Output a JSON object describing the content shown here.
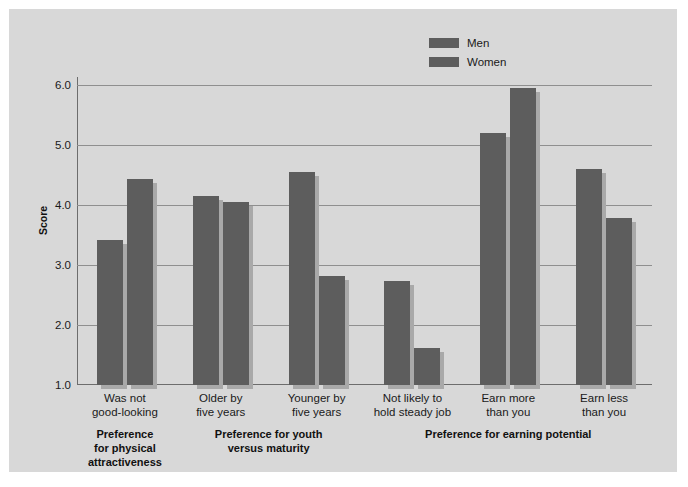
{
  "chart_data": {
    "type": "bar",
    "title": "",
    "subtitle": "",
    "xlabel": "",
    "ylabel": "Score",
    "ylim": [
      1.0,
      6.0
    ],
    "yticks": [
      "1.0",
      "2.0",
      "3.0",
      "4.0",
      "5.0",
      "6.0"
    ],
    "grid": true,
    "legend_position": "top-center-right",
    "categories": [
      "Was not\ngood-looking",
      "Older by\nfive years",
      "Younger by\nfive years",
      "Not likely to\nhold steady job",
      "Earn more\nthan you",
      "Earn less\nthan you"
    ],
    "series": [
      {
        "name": "Men",
        "color": "#5d5d5d",
        "values": [
          3.42,
          4.15,
          4.55,
          2.73,
          5.2,
          4.6
        ]
      },
      {
        "name": "Women",
        "color": "#5d5d5d",
        "values": [
          4.43,
          4.05,
          2.81,
          1.62,
          5.95,
          3.78
        ]
      }
    ],
    "group_bands": [
      {
        "label": "Preference\nfor physical\nattractiveness",
        "categories": [
          0
        ]
      },
      {
        "label": "Preference for youth\nversus maturity",
        "categories": [
          1,
          2
        ]
      },
      {
        "label": "Preference for earning potential",
        "categories": [
          3,
          4,
          5
        ]
      }
    ]
  },
  "axis": {
    "y_label": "Score",
    "y_tick_labels": [
      "6.0",
      "5.0",
      "4.0",
      "3.0",
      "2.0",
      "1.0"
    ],
    "y_tick_values": [
      6.0,
      5.0,
      4.0,
      3.0,
      2.0,
      1.0
    ]
  },
  "legend": {
    "items": [
      {
        "label": "Men",
        "color": "#5d5d5d"
      },
      {
        "label": "Women",
        "color": "#5d5d5d"
      }
    ]
  },
  "categories": [
    {
      "line1": "Was not",
      "line2": "good-looking"
    },
    {
      "line1": "Older by",
      "line2": "five years"
    },
    {
      "line1": "Younger by",
      "line2": "five years"
    },
    {
      "line1": "Not likely to",
      "line2": "hold steady job"
    },
    {
      "line1": "Earn more",
      "line2": "than you"
    },
    {
      "line1": "Earn less",
      "line2": "than you"
    }
  ],
  "group_labels": [
    {
      "line1": "Preference",
      "line2": "for physical",
      "line3": "attractiveness"
    },
    {
      "line1": "Preference for youth",
      "line2": "versus maturity",
      "line3": ""
    },
    {
      "line1": "Preference for earning potential",
      "line2": "",
      "line3": ""
    }
  ],
  "colors": {
    "background": "#d8d8d8",
    "bar_front": "#5d5d5d",
    "bar_shadow": "#a9a9a9",
    "gridline": "#8f8f8f",
    "axis": "#6d6d6d",
    "text": "#1a1a1a"
  }
}
